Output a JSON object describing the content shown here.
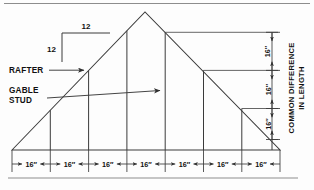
{
  "figure": {
    "line_color": "#3a3a3a",
    "text_color": "#111111",
    "background": "#fdfdfd"
  },
  "labels": {
    "rafter": "RAFTER",
    "gable_stud_line1": "GABLE",
    "gable_stud_line2": "STUD",
    "common_difference_line1": "COMMON DIFFERENCE",
    "common_difference_line2": "IN LENGTH"
  },
  "pitch": {
    "rise": "12",
    "run": "12"
  },
  "bottom_dimensions": {
    "count": 7,
    "values": [
      "16″",
      "16″",
      "16″",
      "16″",
      "16″",
      "16″",
      "16″"
    ]
  },
  "side_dimensions": {
    "count": 3,
    "values": [
      "16″",
      "16″",
      "16″"
    ]
  },
  "geometry": {
    "apex_x": 145,
    "apex_y": 12,
    "base_left_x": 12,
    "base_right_x": 280,
    "base_y": 150,
    "stud_count": 7,
    "spacing_px": 38.3
  }
}
